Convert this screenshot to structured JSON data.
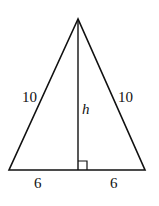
{
  "diagram": {
    "type": "isosceles-triangle-with-altitude",
    "stroke_color": "#111111",
    "background": "#ffffff",
    "vertices": {
      "apex": [
        78,
        19
      ],
      "base_left": [
        9,
        170
      ],
      "base_right": [
        145,
        170
      ],
      "altitude_foot": [
        78,
        170
      ]
    },
    "labels": {
      "left_side": "10",
      "right_side": "10",
      "altitude": "h",
      "base_left_segment": "6",
      "base_right_segment": "6"
    },
    "right_angle_marker": true
  }
}
